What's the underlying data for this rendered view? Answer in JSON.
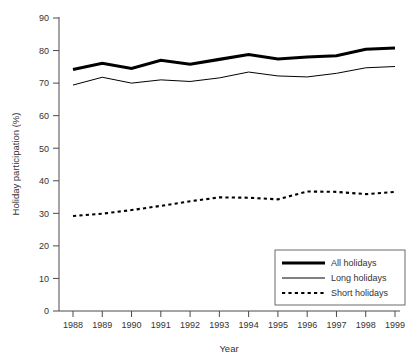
{
  "chart_data": {
    "type": "line",
    "title": "",
    "xlabel": "Year",
    "ylabel": "Holiday participation (%)",
    "categories": [
      "1988",
      "1989",
      "1990",
      "1991",
      "1992",
      "1993",
      "1994",
      "1995",
      "1996",
      "1997",
      "1998",
      "1999"
    ],
    "x": [
      1988,
      1989,
      1990,
      1991,
      1992,
      1993,
      1994,
      1995,
      1996,
      1997,
      1998,
      1999
    ],
    "ylim": [
      0,
      90
    ],
    "yticks": [
      0,
      10,
      20,
      30,
      40,
      50,
      60,
      70,
      80,
      90
    ],
    "xlim": [
      1988,
      1999
    ],
    "grid": false,
    "legend_position": "bottom-right",
    "series": [
      {
        "name": "All holidays",
        "style": "thick-solid",
        "color": "#000000",
        "values": [
          74.2,
          76.1,
          74.5,
          77.0,
          75.8,
          77.3,
          78.8,
          77.4,
          78.0,
          78.4,
          80.4,
          80.8
        ]
      },
      {
        "name": "Long holidays",
        "style": "thin-solid",
        "color": "#000000",
        "values": [
          69.4,
          71.8,
          70.0,
          71.0,
          70.5,
          71.6,
          73.4,
          72.2,
          71.9,
          73.0,
          74.7,
          75.1
        ]
      },
      {
        "name": "Short holidays",
        "style": "dotted",
        "color": "#000000",
        "values": [
          29.2,
          29.9,
          31.0,
          32.3,
          33.7,
          34.9,
          34.8,
          34.3,
          36.7,
          36.6,
          35.9,
          36.6
        ]
      }
    ]
  },
  "legend": {
    "items": [
      {
        "label": "All holidays"
      },
      {
        "label": "Long holidays"
      },
      {
        "label": "Short holidays"
      }
    ]
  },
  "axes": {
    "y_title": "Holiday participation (%)",
    "x_title": "Year",
    "y_tick_labels": [
      "90",
      "80",
      "70",
      "60",
      "50",
      "40",
      "30",
      "20",
      "10",
      "0"
    ],
    "x_tick_labels": [
      "1988",
      "1989",
      "1990",
      "1991",
      "1992",
      "1993",
      "1994",
      "1995",
      "1996",
      "1997",
      "1998",
      "1999"
    ]
  }
}
